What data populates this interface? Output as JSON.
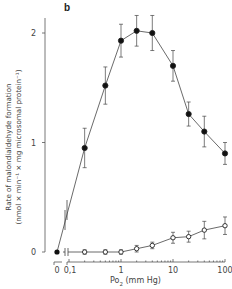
{
  "panel_label": "b",
  "chart_data": {
    "type": "line",
    "title": "",
    "panel": "b",
    "xlabel": "Po2 (mm Hg)",
    "ylabel_line1": "Rate of malondialdehyde formation",
    "ylabel_line2": "(nmol × min⁻¹ × mg microsomal protein⁻¹)",
    "x_scale": "log (with break between 0 and 0.1)",
    "x_ticks": [
      "0",
      "0,1",
      "1",
      "10",
      "100"
    ],
    "y_ticks": [
      "0",
      "1",
      "2"
    ],
    "ylim": [
      0,
      2.2
    ],
    "grid": false,
    "legend": "none",
    "x": [
      0.2,
      0.5,
      1,
      2,
      4,
      10,
      20,
      40,
      100
    ],
    "series": [
      {
        "name": "filled circles",
        "marker": "filled-circle",
        "x0_value": 0,
        "values": [
          0.95,
          1.52,
          1.93,
          2.02,
          2.0,
          1.7,
          1.26,
          1.1,
          0.9
        ],
        "errors": [
          0.18,
          0.17,
          0.15,
          0.14,
          0.16,
          0.14,
          0.11,
          0.14,
          0.1
        ]
      },
      {
        "name": "open circles",
        "marker": "open-circle",
        "values": [
          0.0,
          0.0,
          0.0,
          0.03,
          0.06,
          0.13,
          0.14,
          0.2,
          0.24
        ],
        "errors": [
          0.02,
          0.02,
          0.02,
          0.03,
          0.03,
          0.05,
          0.05,
          0.08,
          0.08
        ]
      }
    ]
  },
  "labels": {
    "xlabel_main": "Po",
    "xlabel_sub": "2",
    "xlabel_unit": " (mm Hg)"
  }
}
